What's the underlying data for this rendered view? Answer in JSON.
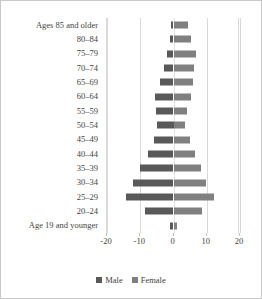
{
  "chart_data": {
    "type": "bar",
    "chart_style": "population-pyramid",
    "title": "",
    "subtitle": "",
    "xlabel": "",
    "ylabel": "",
    "xlim": [
      -20,
      20
    ],
    "xticks": [
      -20,
      -10,
      0,
      10,
      20
    ],
    "xtick_labels": [
      "-20",
      "-10",
      "0",
      "10",
      "20"
    ],
    "grid": true,
    "grid_axis": "x",
    "legend_position": "bottom",
    "orientation": "horizontal",
    "categories": [
      "Ages 85 and older",
      "80–84",
      "75–79",
      "70–74",
      "65–69",
      "60–64",
      "55–59",
      "50–54",
      "45–49",
      "40–44",
      "35–39",
      "30–34",
      "25–29",
      "20–24",
      "Age 19 and younger"
    ],
    "series": [
      {
        "name": "Male",
        "color": "#595959",
        "note": "plotted as negative values on the left of zero",
        "values": [
          -0.7,
          -1.2,
          -2.1,
          -3.0,
          -4.0,
          -5.5,
          -5.2,
          -5.0,
          -6.0,
          -7.8,
          -10.2,
          -12.2,
          -14.2,
          -8.5,
          -1.0
        ]
      },
      {
        "name": "Female",
        "color": "#808080",
        "note": "plotted as positive values on the right of zero",
        "values": [
          4.5,
          5.4,
          6.8,
          6.2,
          5.8,
          5.4,
          4.0,
          3.6,
          5.0,
          6.6,
          8.4,
          9.8,
          12.2,
          8.6,
          1.2
        ]
      }
    ]
  },
  "legend": {
    "items": [
      {
        "label": "Male",
        "color": "#595959"
      },
      {
        "label": "Female",
        "color": "#808080"
      }
    ]
  },
  "colors": {
    "male": "#595959",
    "female": "#808080",
    "gridline": "#d9d9d9",
    "text": "#3f3f3f",
    "border": "#c8c8c8",
    "background": "#ffffff"
  }
}
